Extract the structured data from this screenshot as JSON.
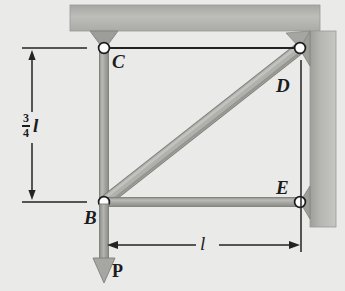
{
  "figure": {
    "name": "statics-truss-free-body-diagram",
    "background_color": "#ececea",
    "support_color": "#b3b3b0",
    "member_color": "#a8a8a5",
    "line_color": "#1c1c1c",
    "joints": [
      {
        "id": "B",
        "label": "B",
        "x": 104,
        "y": 202
      },
      {
        "id": "C",
        "label": "C",
        "x": 104,
        "y": 48
      },
      {
        "id": "D",
        "label": "D",
        "x": 300,
        "y": 48
      },
      {
        "id": "E",
        "label": "E",
        "x": 300,
        "y": 202
      }
    ],
    "labels": {
      "B": "B",
      "C": "C",
      "D": "D",
      "E": "E",
      "force": "P",
      "dim_horizontal": "l",
      "dim_vertical_numerator": "3",
      "dim_vertical_denominator": "4",
      "dim_vertical_unit": "l"
    },
    "members": [
      {
        "name": "column-CB",
        "from": "C",
        "to": "B"
      },
      {
        "name": "diagonal-BD",
        "from": "B",
        "to": "D"
      },
      {
        "name": "tie-BE",
        "from": "B",
        "to": "E"
      }
    ],
    "supports": [
      {
        "name": "ceiling-support-C",
        "type": "pin",
        "at": "C"
      },
      {
        "name": "wall-support-D",
        "type": "pin",
        "at": "D"
      },
      {
        "name": "wall-support-E",
        "type": "pin",
        "at": "E"
      }
    ],
    "load": {
      "name": "applied-load-P",
      "label": "P",
      "direction": "down",
      "at": "B"
    },
    "dimensions": [
      {
        "name": "vertical-dimension",
        "value": "3/4 l",
        "orientation": "vertical"
      },
      {
        "name": "horizontal-dimension",
        "value": "l",
        "orientation": "horizontal"
      }
    ]
  }
}
